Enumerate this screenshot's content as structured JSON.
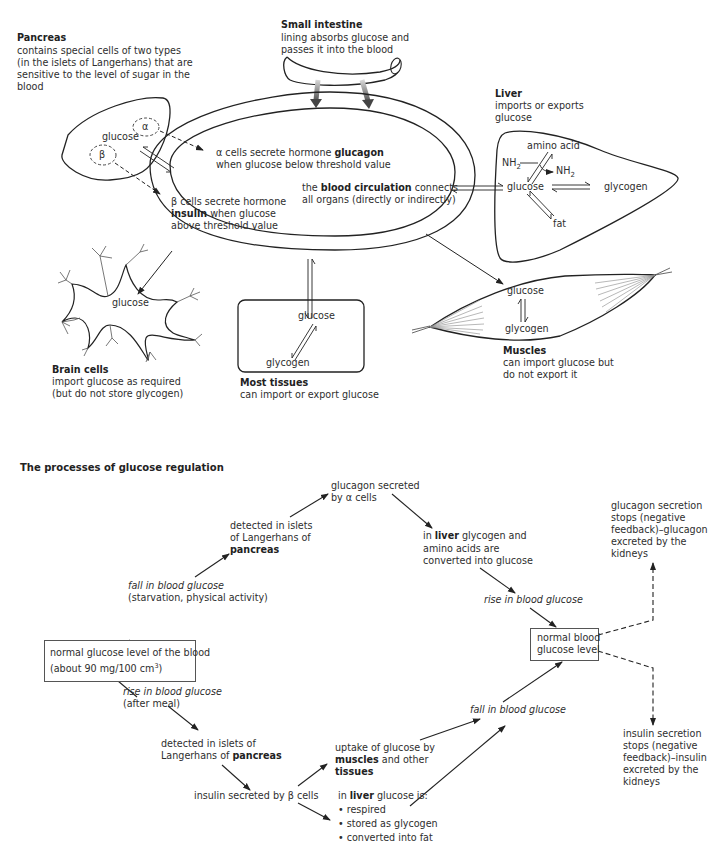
{
  "top_diagram": {
    "pancreas": {
      "title": "Pancreas",
      "desc": [
        "contains special cells of two types",
        "(in the islets of Langerhans) that are",
        "sensitive to the level of sugar in the",
        "blood"
      ],
      "glucose_label": "glucose",
      "alpha_label": "α",
      "beta_label": "β"
    },
    "small_intestine": {
      "title": "Small intestine",
      "desc": [
        "lining absorbs glucose and",
        "passes it into the blood"
      ]
    },
    "circulation": {
      "alpha_text_pre": "α cells secrete hormone ",
      "alpha_text_bold": "glucagon",
      "alpha_text_line2": "when glucose below threshold value",
      "beta_text_line1": "β cells secrete hormone",
      "beta_text_bold": "insulin",
      "beta_text_rest": " when glucose",
      "beta_text_line3": "above threshold value",
      "blood_pre": "the ",
      "blood_bold": "blood circulation",
      "blood_post": " connects",
      "blood_line2": "all organs (directly or indirectly)"
    },
    "liver": {
      "title": "Liver",
      "desc": [
        "imports or exports",
        "glucose"
      ],
      "amino_acid": "amino acid",
      "nh2_in": "NH",
      "nh2_out": "NH",
      "sub2": "2",
      "glucose": "glucose",
      "glycogen": "glycogen",
      "fat": "fat"
    },
    "brain": {
      "title": "Brain cells",
      "desc": [
        "import glucose as required",
        "(but do not store glycogen)"
      ],
      "glucose": "glucose"
    },
    "most_tissues": {
      "title": "Most tissues",
      "desc": [
        "can import or export glucose"
      ],
      "glucose": "glucose",
      "glycogen": "glycogen"
    },
    "muscles": {
      "title": "Muscles",
      "desc": [
        "can import glucose but",
        "do not export it"
      ],
      "glucose": "glucose",
      "glycogen": "glycogen"
    }
  },
  "bottom_diagram": {
    "section_title": "The processes of glucose regulation",
    "normal_level_box": {
      "line1": "normal glucose level of the blood",
      "line2_pre": "(about 90 mg/100 cm",
      "line2_sup": "3",
      "line2_post": ")"
    },
    "fall_label": "fall in blood glucose",
    "fall_cause": "(starvation, physical activity)",
    "detected_upper": [
      "detected in islets",
      "of Langerhans of"
    ],
    "detected_upper_bold": "pancreas",
    "glucagon_secreted": [
      "glucagon secreted",
      "by α cells"
    ],
    "liver_upper_pre": "in ",
    "liver_upper_bold": "liver",
    "liver_upper_post": " glycogen and",
    "liver_upper_rest": [
      "amino acids are",
      "converted into glucose"
    ],
    "rise_label_right": "rise in blood glucose",
    "normal_blood_box": [
      "normal blood",
      "glucose level"
    ],
    "glucagon_stops": [
      "glucagon secretion",
      "stops (negative",
      "feedback)–glucagon",
      "excreted by the",
      "kidneys"
    ],
    "insulin_stops": [
      "insulin secretion",
      "stops (negative",
      "feedback)–insulin",
      "excreted by the",
      "kidneys"
    ],
    "rise_label": "rise in blood glucose",
    "rise_cause": "(after meal)",
    "detected_lower": "detected in islets of",
    "detected_lower_pre": "Langerhans of ",
    "detected_lower_bold": "pancreas",
    "insulin_secreted": "insulin secreted by β cells",
    "uptake_line1": "uptake of glucose by",
    "uptake_bold1": "muscles",
    "uptake_post1": " and other",
    "uptake_bold2": "tissues",
    "liver_lower_pre": "in ",
    "liver_lower_bold": "liver",
    "liver_lower_post": " glucose is:",
    "liver_lower_bullets": [
      "• respired",
      "• stored as glycogen",
      "• converted into fat"
    ],
    "fall_label_lower": "fall in blood glucose"
  }
}
